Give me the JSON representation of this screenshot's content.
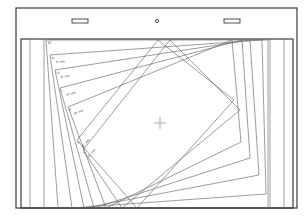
{
  "colors": {
    "background": "#ffffff",
    "frame": "#3a3a3a",
    "lines": "#5a5a5a",
    "crosshair": "#777777"
  },
  "frame": {
    "x": 16,
    "y": 8,
    "w": 281,
    "h": 200
  },
  "header_markers": {
    "left_slot": {
      "x": 72,
      "y": 19,
      "w": 16,
      "h": 4
    },
    "center_hole": {
      "cx": 157,
      "cy": 21,
      "r": 1.6
    },
    "right_slot": {
      "x": 224,
      "y": 19,
      "w": 16,
      "h": 4
    }
  },
  "panel": {
    "x": 21,
    "y": 39,
    "w": 272,
    "h": 169
  },
  "vertical_lines_left": [
    30,
    44
  ],
  "vertical_lines_right": [
    270,
    284
  ],
  "center_crosshair": {
    "cx": 160,
    "cy": 123,
    "size": 6
  },
  "sheets": [
    {
      "label_num": "13",
      "label_angle": "",
      "pts": [
        [
          46,
          40
        ],
        [
          268,
          40
        ],
        [
          268,
          208
        ],
        [
          58,
          208
        ]
      ]
    },
    {
      "label_num": "11",
      "label_angle": "5° mm",
      "pts": [
        [
          50,
          55
        ],
        [
          262,
          40
        ],
        [
          266,
          194
        ],
        [
          72,
          208
        ]
      ]
    },
    {
      "label_num": "15",
      "label_angle": "8° mm",
      "pts": [
        [
          55,
          70
        ],
        [
          250,
          40
        ],
        [
          259,
          175
        ],
        [
          84,
          208
        ]
      ]
    },
    {
      "label_num": "7",
      "label_angle": "10° mm",
      "pts": [
        [
          60,
          88
        ],
        [
          242,
          40
        ],
        [
          250,
          158
        ],
        [
          94,
          208
        ]
      ]
    },
    {
      "label_num": "9",
      "label_angle": "20° mm",
      "pts": [
        [
          68,
          107
        ],
        [
          232,
          40
        ],
        [
          241,
          142
        ],
        [
          106,
          208
        ]
      ]
    },
    {
      "label_num": "3",
      "label_angle": "25° mm",
      "pts": [
        [
          77,
          140
        ],
        [
          158,
          40
        ],
        [
          234,
          100
        ],
        [
          137,
          208
        ]
      ]
    },
    {
      "label_num": "5",
      "label_angle": "30° mm",
      "pts": [
        [
          83,
          150
        ],
        [
          170,
          40
        ],
        [
          240,
          110
        ],
        [
          122,
          208
        ]
      ]
    }
  ]
}
